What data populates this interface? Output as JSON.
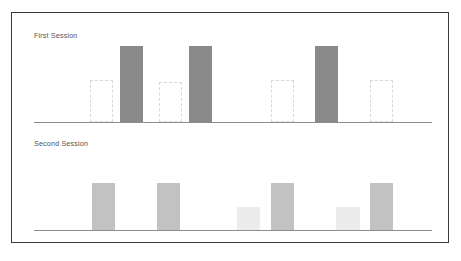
{
  "figure": {
    "background": "#ffffff",
    "border_color": "#3a3a3a",
    "baseline_color": "#8e8e8e"
  },
  "colors": {
    "solid_dark": "#8a8a8a",
    "solid_mid": "#c2c2c2",
    "solid_pale": "#ececec",
    "ghost_outline": "#d8d8d8",
    "title_text": "#545454"
  },
  "panels": [
    {
      "id": "first-session",
      "title": "First Session"
    },
    {
      "id": "second-session",
      "title": "Second Session"
    }
  ],
  "chart_data": [
    {
      "type": "bar",
      "title": "First Session",
      "xlabel": "",
      "ylabel": "",
      "ylim": [
        0,
        100
      ],
      "grid": false,
      "legend": "none",
      "axis": "baseline only, no tick labels",
      "categories": [
        "1",
        "2",
        "3",
        "4",
        "5",
        "6",
        "7",
        "8",
        "9",
        "10"
      ],
      "series": [
        {
          "name": "outline (unfilled)",
          "style": "dashed-outline",
          "values": [
            0,
            55,
            0,
            0,
            52,
            0,
            0,
            0,
            55,
            0,
            55,
            0
          ]
        },
        {
          "name": "filled",
          "style": "solid",
          "values": [
            0,
            0,
            100,
            0,
            0,
            100,
            0,
            0,
            0,
            100,
            0,
            0
          ]
        }
      ],
      "bars": [
        {
          "x_pct": 14.0,
          "width_pct": 5.8,
          "height_pct": 55,
          "style": "ghost"
        },
        {
          "x_pct": 21.5,
          "width_pct": 5.8,
          "height_pct": 100,
          "style": "solid-dark"
        },
        {
          "x_pct": 31.5,
          "width_pct": 5.8,
          "height_pct": 52,
          "style": "ghost"
        },
        {
          "x_pct": 39.0,
          "width_pct": 5.8,
          "height_pct": 100,
          "style": "solid-dark"
        },
        {
          "x_pct": 59.5,
          "width_pct": 5.8,
          "height_pct": 55,
          "style": "ghost"
        },
        {
          "x_pct": 70.5,
          "width_pct": 5.8,
          "height_pct": 100,
          "style": "solid-dark"
        },
        {
          "x_pct": 84.5,
          "width_pct": 5.8,
          "height_pct": 55,
          "style": "ghost"
        }
      ]
    },
    {
      "type": "bar",
      "title": "Second Session",
      "xlabel": "",
      "ylabel": "",
      "ylim": [
        0,
        100
      ],
      "grid": false,
      "legend": "none",
      "axis": "baseline only, no tick labels",
      "categories": [
        "1",
        "2",
        "3",
        "4",
        "5",
        "6",
        "7",
        "8",
        "9",
        "10"
      ],
      "series": [
        {
          "name": "filled",
          "style": "solid",
          "values": [
            0,
            62,
            0,
            62,
            0,
            0,
            62,
            0,
            62,
            0
          ]
        },
        {
          "name": "pale",
          "style": "solid-light",
          "values": [
            0,
            0,
            0,
            0,
            0,
            30,
            0,
            30,
            0,
            0
          ]
        }
      ],
      "bars": [
        {
          "x_pct": 14.5,
          "width_pct": 5.8,
          "height_pct": 62,
          "style": "solid-mid"
        },
        {
          "x_pct": 31.0,
          "width_pct": 5.8,
          "height_pct": 62,
          "style": "solid-mid"
        },
        {
          "x_pct": 51.0,
          "width_pct": 5.8,
          "height_pct": 30,
          "style": "solid-pale"
        },
        {
          "x_pct": 59.5,
          "width_pct": 5.8,
          "height_pct": 62,
          "style": "solid-mid"
        },
        {
          "x_pct": 76.0,
          "width_pct": 5.8,
          "height_pct": 30,
          "style": "solid-pale"
        },
        {
          "x_pct": 84.5,
          "width_pct": 5.8,
          "height_pct": 62,
          "style": "solid-mid"
        }
      ]
    }
  ]
}
